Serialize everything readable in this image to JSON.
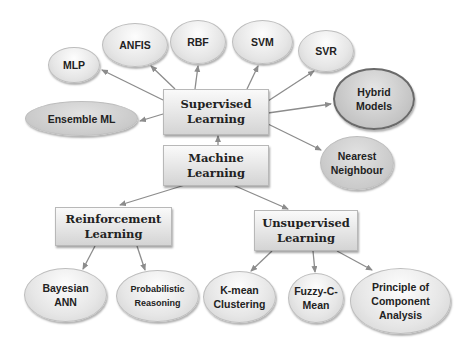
{
  "diagram": {
    "root": {
      "label": "Machine\nLearning"
    },
    "categories": {
      "supervised": {
        "label": "Supervised\nLearning"
      },
      "reinforcement": {
        "label": "Reinforcement\nLearning"
      },
      "unsupervised": {
        "label": "Unsupervised\nLearning"
      }
    },
    "supervised_children": [
      {
        "label": "MLP"
      },
      {
        "label": "ANFIS"
      },
      {
        "label": "RBF"
      },
      {
        "label": "SVM"
      },
      {
        "label": "SVR"
      },
      {
        "label": "Hybrid\nModels"
      },
      {
        "label": "Nearest\nNeighbour"
      },
      {
        "label": "Ensemble ML"
      }
    ],
    "reinforcement_children": [
      {
        "label": "Bayesian\nANN"
      },
      {
        "label": "Probabilistic\nReasoning"
      }
    ],
    "unsupervised_children": [
      {
        "label": "K-mean\nClustering"
      },
      {
        "label": "Fuzzy-C-\nMean"
      },
      {
        "label": "Principle of\nComponent\nAnalysis"
      }
    ],
    "colors": {
      "arrow": "#8c8c8c",
      "box_top": "#fafafa",
      "box_bottom": "#d4d4d4",
      "hybrid_border": "#6a6a6a"
    }
  }
}
